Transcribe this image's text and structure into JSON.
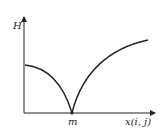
{
  "diagram": {
    "y_axis_label": "H",
    "x_axis_label": "x(i, j)",
    "minimum_point_label": "m",
    "curve": {
      "description": "Cusp-shaped curve with minimum at m on the x-axis; left branch starts at mid height and falls concave-down to m; right branch rises concave-down from m toward upper right",
      "color": "#222222"
    }
  }
}
